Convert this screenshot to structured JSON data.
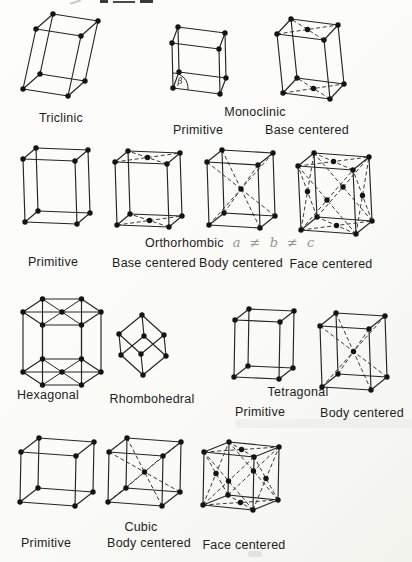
{
  "colors": {
    "ink": "#1d1d1d",
    "paper": "#fbfbf8",
    "annotation_gray": "#97978f"
  },
  "figure_labels": {
    "triclinic": "Triclinic",
    "monoclinic_title": "Monoclinic",
    "monoclinic_primitive": "Primitive",
    "monoclinic_base_centered": "Base centered",
    "orthorhombic_title": "Orthorhombic",
    "orthorhombic_annotation": "a ≠ b ≠ c",
    "orthorhombic_primitive": "Primitive",
    "orthorhombic_base_centered": "Base centered",
    "orthorhombic_body_centered": "Body centered",
    "orthorhombic_face_centered": "Face centered",
    "hexagonal": "Hexagonal",
    "rhombohedral": "Rhombohedral",
    "tetragonal_title": "Tetragonal",
    "tetragonal_primitive": "Primitive",
    "tetragonal_body_centered": "Body centered",
    "cubic_title": "Cubic",
    "cubic_primitive": "Primitive",
    "cubic_body_centered": "Body centered",
    "cubic_face_centered": "Face centered"
  },
  "figure": {
    "atom_radius": 2.7,
    "beta_label": "β",
    "cells": [
      {
        "name": "triclinic",
        "o": [
          23,
          89
        ],
        "a": [
          45,
          7
        ],
        "b": [
          17,
          -15
        ],
        "c": [
          13,
          -60
        ],
        "deco": "none"
      },
      {
        "name": "monoclinic-primitive",
        "o": [
          173,
          88
        ],
        "a": [
          47,
          6
        ],
        "b": [
          6,
          -16
        ],
        "c": [
          -1,
          -45
        ],
        "deco": "none",
        "beta": {
          "r": 15,
          "label_dx": 4.5,
          "label_dy": -4
        }
      },
      {
        "name": "monoclinic-base-centered",
        "o": [
          283,
          93
        ],
        "a": [
          47,
          6
        ],
        "b": [
          14,
          -15
        ],
        "c": [
          -6,
          -59
        ],
        "deco": "base"
      },
      {
        "name": "orthorhombic-primitive",
        "o": [
          25,
          222
        ],
        "a": [
          52,
          2
        ],
        "b": [
          13,
          -11
        ],
        "c": [
          -2,
          -63
        ],
        "deco": "none"
      },
      {
        "name": "orthorhombic-base-centered",
        "o": [
          117,
          225
        ],
        "a": [
          52,
          2
        ],
        "b": [
          13,
          -11
        ],
        "c": [
          -2,
          -63
        ],
        "deco": "base"
      },
      {
        "name": "orthorhombic-body-centered",
        "o": [
          209,
          225
        ],
        "a": [
          51,
          3
        ],
        "b": [
          15,
          -12
        ],
        "c": [
          -2,
          -63
        ],
        "deco": "body"
      },
      {
        "name": "orthorhombic-face-centered",
        "o": [
          301,
          230
        ],
        "a": [
          55,
          4
        ],
        "b": [
          16,
          -13
        ],
        "c": [
          -3,
          -64
        ],
        "deco": "face"
      },
      {
        "name": "rhombohedral",
        "o": [
          143,
          375
        ],
        "a": [
          -22,
          -20
        ],
        "b": [
          -2,
          -21
        ],
        "c": [
          23,
          -19
        ],
        "deco": "none"
      },
      {
        "name": "tetragonal-primitive",
        "o": [
          234,
          377
        ],
        "a": [
          45,
          2
        ],
        "b": [
          14,
          -11
        ],
        "c": [
          1,
          -57
        ],
        "deco": "none"
      },
      {
        "name": "tetragonal-body-centered",
        "o": [
          322,
          387
        ],
        "a": [
          49,
          3
        ],
        "b": [
          16,
          -13
        ],
        "c": [
          -2,
          -61
        ],
        "deco": "body"
      },
      {
        "name": "cubic-primitive",
        "o": [
          20,
          502
        ],
        "a": [
          55,
          4
        ],
        "b": [
          18,
          -14
        ],
        "c": [
          1,
          -50
        ],
        "deco": "none"
      },
      {
        "name": "cubic-body-centered",
        "o": [
          108,
          502
        ],
        "a": [
          54,
          4
        ],
        "b": [
          18,
          -14
        ],
        "c": [
          1,
          -50
        ],
        "deco": "body"
      },
      {
        "name": "cubic-face-centered",
        "o": [
          203,
          505
        ],
        "a": [
          50,
          5
        ],
        "b": [
          25,
          -10
        ],
        "c": [
          1,
          -53
        ],
        "deco": "face"
      }
    ],
    "hexagonal": {
      "cx": 62,
      "cy_top": 312,
      "cy_bottom": 372,
      "rx": 39,
      "ry": 15
    }
  }
}
